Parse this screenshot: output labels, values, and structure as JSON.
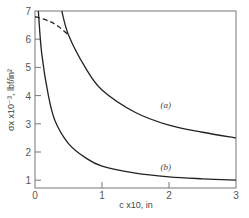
{
  "chart_data": {
    "type": "line",
    "title": "",
    "xlabel": "c x10, in",
    "ylabel": "σx x10⁻³, lbf/in²",
    "xlim": [
      0,
      3
    ],
    "ylim": [
      0.7,
      7
    ],
    "grid": false,
    "legend": "none (inline curve labels)",
    "x_ticks": [
      "0",
      "1",
      "2",
      "3"
    ],
    "y_ticks": [
      "1",
      "2",
      "3",
      "4",
      "5",
      "6",
      "7"
    ],
    "series": [
      {
        "name": "(a)",
        "style": "solid",
        "x": [
          0.4,
          0.5,
          0.75,
          1.0,
          1.5,
          2.0,
          2.5,
          3.0
        ],
        "y": [
          7.0,
          6.15,
          5.0,
          4.2,
          3.4,
          2.95,
          2.7,
          2.5
        ]
      },
      {
        "name": "(b)",
        "style": "solid",
        "x": [
          0.05,
          0.1,
          0.2,
          0.3,
          0.5,
          0.75,
          1.0,
          1.5,
          2.0,
          2.5,
          3.0
        ],
        "y": [
          7.0,
          5.5,
          4.0,
          3.1,
          2.3,
          1.8,
          1.5,
          1.25,
          1.12,
          1.05,
          1.0
        ]
      },
      {
        "name": "(a) dashed extension",
        "style": "dashed",
        "x": [
          0.0,
          0.2,
          0.35,
          0.5
        ],
        "y": [
          6.8,
          6.65,
          6.45,
          6.15
        ]
      }
    ],
    "annotations": [
      {
        "text": "(a)",
        "x": 1.95,
        "y": 3.55
      },
      {
        "text": "(b)",
        "x": 1.95,
        "y": 1.35
      }
    ]
  },
  "labels": {
    "xlabel": "c x10, in",
    "ylabel": "σx x10⁻³, lbf/in²",
    "curve_a": "(a)",
    "curve_b": "(b)"
  }
}
